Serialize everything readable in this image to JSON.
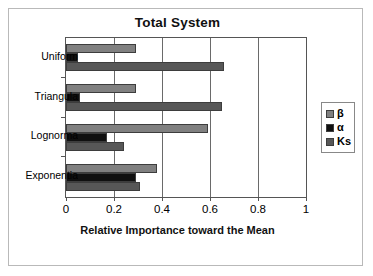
{
  "chart_data": {
    "type": "bar",
    "orientation": "horizontal",
    "title": "Total System",
    "xlabel": "Relative Importance toward the Mean",
    "ylabel": "",
    "xlim": [
      0,
      1
    ],
    "xticks": [
      "0",
      "0.2",
      "0.4",
      "0.6",
      "0.8",
      "1"
    ],
    "xtick_values": [
      0,
      0.2,
      0.4,
      0.6,
      0.8,
      1
    ],
    "grid": true,
    "legend_position": "right",
    "categories": [
      "Uniform",
      "Triangula",
      "Lognorma",
      "Exponentia"
    ],
    "series": [
      {
        "name": "β",
        "color": "#808080",
        "values": [
          0.29,
          0.29,
          0.59,
          0.38
        ]
      },
      {
        "name": "α",
        "color": "#101010",
        "values": [
          0.05,
          0.06,
          0.17,
          0.29
        ]
      },
      {
        "name": "Ks",
        "color": "#575757",
        "values": [
          0.66,
          0.65,
          0.24,
          0.31
        ]
      }
    ]
  },
  "legend": {
    "entries": [
      {
        "label": "β"
      },
      {
        "label": "α"
      },
      {
        "label": "Ks"
      }
    ]
  }
}
